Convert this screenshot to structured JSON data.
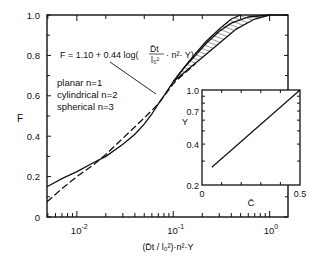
{
  "chart_data": {
    "type": "line",
    "title": "",
    "xlabel": "(D̄t / l₀²)·n²·Y",
    "ylabel": "F",
    "xscale": "log",
    "xlim": [
      0.0049,
      1.55
    ],
    "ylim": [
      0,
      1.0
    ],
    "x_tick_labels": [
      {
        "value": 0.01,
        "base": "10",
        "exp": "-2"
      },
      {
        "value": 0.1,
        "base": "10",
        "exp": "-1"
      },
      {
        "value": 1,
        "base": "10",
        "exp": "0"
      }
    ],
    "y_ticks": [
      0,
      0.2,
      0.4,
      0.6,
      0.8,
      1.0
    ],
    "y_tick_labels": [
      "0",
      "0.2",
      "0.4",
      "0.6",
      "0.8",
      "1.0"
    ],
    "grid": false,
    "annotations": {
      "formula_prefix": "F = 1.10 + 0.44 log(",
      "formula_num": "D̄t",
      "formula_den": "l₀²",
      "formula_suffix": "· n²· Y)",
      "legend_lines": [
        "planar  n=1",
        "cylindrical  n=2",
        "spherical  n=3"
      ]
    },
    "series": [
      {
        "name": "solid curve (exact solution)",
        "style": "solid",
        "points": [
          [
            0.0049,
            0.15
          ],
          [
            0.007,
            0.19
          ],
          [
            0.01,
            0.225
          ],
          [
            0.015,
            0.27
          ],
          [
            0.02,
            0.3
          ],
          [
            0.03,
            0.36
          ],
          [
            0.04,
            0.41
          ],
          [
            0.05,
            0.46
          ],
          [
            0.06,
            0.51
          ],
          [
            0.07,
            0.56
          ],
          [
            0.08,
            0.6
          ],
          [
            0.1,
            0.67
          ],
          [
            0.13,
            0.74
          ],
          [
            0.17,
            0.8
          ],
          [
            0.22,
            0.86
          ],
          [
            0.3,
            0.92
          ],
          [
            0.4,
            0.96
          ],
          [
            0.6,
            0.99
          ],
          [
            1.0,
            1.0
          ],
          [
            1.55,
            1.0
          ]
        ]
      },
      {
        "name": "dashed curve F = 1.10 + 0.44 log(D̄t/l₀² · n² · Y)",
        "style": "dashed",
        "points": [
          [
            0.0049,
            0.075
          ],
          [
            0.007,
            0.14
          ],
          [
            0.01,
            0.2
          ],
          [
            0.015,
            0.26
          ],
          [
            0.02,
            0.31
          ],
          [
            0.03,
            0.39
          ],
          [
            0.05,
            0.49
          ],
          [
            0.07,
            0.56
          ],
          [
            0.1,
            0.66
          ],
          [
            0.13,
            0.71
          ],
          [
            0.17,
            0.76
          ]
        ]
      },
      {
        "name": "upper boundary of hatched band",
        "style": "solid",
        "points": [
          [
            0.1,
            0.67
          ],
          [
            0.13,
            0.74
          ],
          [
            0.17,
            0.81
          ],
          [
            0.22,
            0.87
          ],
          [
            0.3,
            0.93
          ],
          [
            0.4,
            0.98
          ],
          [
            0.5,
            1.0
          ]
        ]
      },
      {
        "name": "lower boundary of hatched band",
        "style": "solid",
        "points": [
          [
            0.1,
            0.67
          ],
          [
            0.15,
            0.74
          ],
          [
            0.2,
            0.79
          ],
          [
            0.3,
            0.86
          ],
          [
            0.45,
            0.93
          ],
          [
            0.7,
            0.98
          ],
          [
            1.0,
            1.0
          ]
        ]
      }
    ],
    "inset": {
      "type": "line",
      "xlabel": "C̄",
      "ylabel": "Y",
      "xlim": [
        0,
        0.5
      ],
      "ylim": [
        0.2,
        1.0
      ],
      "yscale": "log",
      "x_tick_labels": [
        "0",
        "0.5"
      ],
      "y_tick_labels": [
        "0.2",
        "0.4",
        "0.7",
        "1.0"
      ],
      "y_ticks": [
        0.2,
        0.4,
        0.7,
        1.0
      ],
      "series": [
        {
          "name": "Y vs C̄",
          "points": [
            [
              0.05,
              0.27
            ],
            [
              0.5,
              1.0
            ]
          ]
        }
      ]
    }
  }
}
